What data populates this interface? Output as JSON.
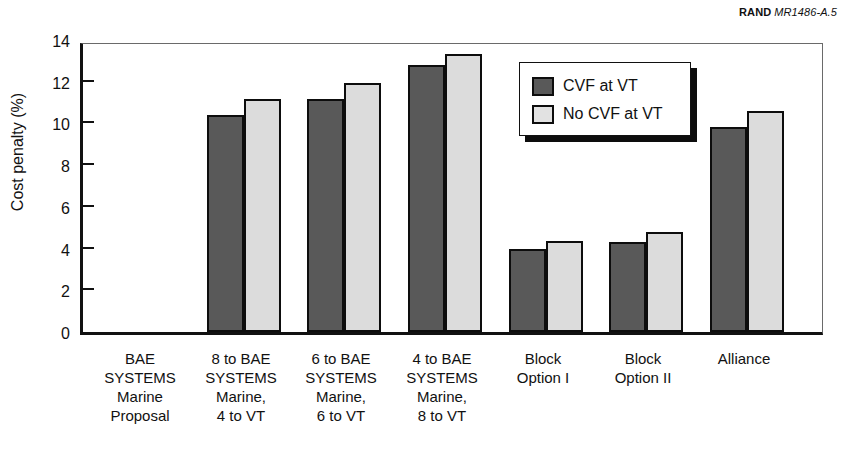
{
  "credit": {
    "org": "RAND",
    "doc_id": "MR1486-A.5"
  },
  "chart_data": {
    "type": "bar",
    "title": "",
    "xlabel": "",
    "ylabel": "Cost penalty (%)",
    "ylim": [
      0,
      14
    ],
    "yticks": [
      0,
      2,
      4,
      6,
      8,
      10,
      12,
      14
    ],
    "grid": false,
    "legend_position": "top-center-right",
    "categories": [
      "BAE\nSYSTEMS\nMarine\nProposal",
      "8 to BAE\nSYSTEMS\nMarine,\n4 to VT",
      "6 to BAE\nSYSTEMS\nMarine,\n6 to VT",
      "4 to BAE\nSYSTEMS\nMarine,\n8 to VT",
      "Block\nOption I",
      "Block\nOption II",
      "Alliance"
    ],
    "category_lines": [
      [
        "BAE",
        "SYSTEMS",
        "Marine",
        "Proposal"
      ],
      [
        "8 to BAE",
        "SYSTEMS",
        "Marine,",
        "4 to VT"
      ],
      [
        "6 to BAE",
        "SYSTEMS",
        "Marine,",
        "6 to VT"
      ],
      [
        "4 to BAE",
        "SYSTEMS",
        "Marine,",
        "8 to VT"
      ],
      [
        "Block",
        "Option I"
      ],
      [
        "Block",
        "Option II"
      ],
      [
        "Alliance"
      ]
    ],
    "series": [
      {
        "name": "CVF at VT",
        "color": "#595959",
        "values": [
          0,
          10.4,
          11.15,
          12.8,
          4.0,
          4.3,
          9.85
        ]
      },
      {
        "name": "No CVF at VT",
        "color": "#dcdcdc",
        "values": [
          0,
          11.15,
          11.95,
          13.35,
          4.35,
          4.8,
          10.6
        ]
      }
    ]
  },
  "legend": {
    "items": [
      {
        "label": "CVF at VT",
        "swatch": "dark"
      },
      {
        "label": "No CVF at VT",
        "swatch": "light"
      }
    ]
  },
  "geometry": {
    "plot_left": 80,
    "plot_top": 43,
    "plot_width": 743,
    "plot_height": 292,
    "group_centers": [
      140,
      241,
      341,
      442,
      543,
      643,
      744
    ],
    "bar_width": 37
  }
}
